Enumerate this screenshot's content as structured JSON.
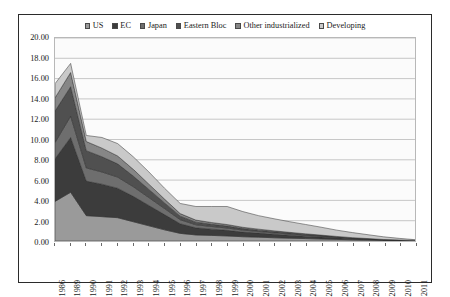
{
  "legend": {
    "position": "top",
    "items": [
      {
        "label": "US",
        "color": "#9a9a9a"
      },
      {
        "label": "EC",
        "color": "#3c3c3c"
      },
      {
        "label": "Japan",
        "color": "#6e6e6e"
      },
      {
        "label": "Eastern Bloc",
        "color": "#505050"
      },
      {
        "label": "Other industrialized",
        "color": "#868686"
      },
      {
        "label": "Developing",
        "color": "#c9c9c9"
      }
    ]
  },
  "axis": {
    "y_ticks": [
      "20.00",
      "18.00",
      "16.00",
      "14.00",
      "12.00",
      "10.00",
      "8.00",
      "6.00",
      "4.00",
      "2.00",
      "0.00"
    ]
  },
  "chart_data": {
    "type": "area",
    "stacked": true,
    "title": "",
    "xlabel": "",
    "ylabel": "",
    "ylim": [
      0,
      20
    ],
    "ytick_step": 2,
    "grid": true,
    "legend_position": "top",
    "categories": [
      "1986",
      "1989",
      "1990",
      "1991",
      "1992",
      "1993",
      "1994",
      "1995",
      "1996",
      "1997",
      "1998",
      "1999",
      "2000",
      "2001",
      "2002",
      "2003",
      "2004",
      "2005",
      "2006",
      "2007",
      "2008",
      "2009",
      "2010",
      "2011"
    ],
    "series": [
      {
        "name": "US",
        "color": "#9a9a9a",
        "values": [
          3.9,
          4.8,
          2.5,
          2.4,
          2.3,
          1.9,
          1.5,
          1.1,
          0.75,
          0.6,
          0.55,
          0.5,
          0.42,
          0.38,
          0.32,
          0.28,
          0.24,
          0.2,
          0.16,
          0.12,
          0.09,
          0.06,
          0.04,
          0.02
        ]
      },
      {
        "name": "EC",
        "color": "#3c3c3c",
        "values": [
          4.2,
          5.4,
          3.4,
          3.2,
          2.9,
          2.5,
          2.0,
          1.5,
          0.95,
          0.7,
          0.62,
          0.55,
          0.46,
          0.4,
          0.34,
          0.29,
          0.24,
          0.19,
          0.15,
          0.11,
          0.08,
          0.05,
          0.03,
          0.02
        ]
      },
      {
        "name": "Japan",
        "color": "#6e6e6e",
        "values": [
          1.6,
          2.1,
          1.3,
          1.2,
          1.1,
          0.95,
          0.78,
          0.6,
          0.4,
          0.3,
          0.26,
          0.23,
          0.19,
          0.16,
          0.14,
          0.12,
          0.1,
          0.08,
          0.06,
          0.04,
          0.03,
          0.02,
          0.01,
          0.01
        ]
      },
      {
        "name": "Eastern Bloc",
        "color": "#505050",
        "values": [
          3.1,
          2.9,
          1.7,
          1.5,
          1.3,
          1.05,
          0.8,
          0.55,
          0.35,
          0.26,
          0.22,
          0.19,
          0.16,
          0.13,
          0.11,
          0.09,
          0.07,
          0.06,
          0.04,
          0.03,
          0.02,
          0.01,
          0.01,
          0.0
        ]
      },
      {
        "name": "Other industrialized",
        "color": "#868686",
        "values": [
          1.3,
          1.4,
          0.9,
          0.85,
          0.78,
          0.66,
          0.52,
          0.38,
          0.25,
          0.2,
          0.17,
          0.15,
          0.12,
          0.1,
          0.09,
          0.07,
          0.06,
          0.05,
          0.04,
          0.03,
          0.02,
          0.01,
          0.01,
          0.0
        ]
      },
      {
        "name": "Developing",
        "color": "#c9c9c9",
        "values": [
          1.4,
          0.9,
          0.6,
          1.05,
          1.22,
          1.24,
          1.2,
          1.07,
          1.0,
          1.34,
          1.58,
          1.78,
          1.55,
          1.33,
          1.19,
          1.05,
          0.92,
          0.78,
          0.62,
          0.5,
          0.38,
          0.26,
          0.16,
          0.08
        ]
      }
    ],
    "totals": [
      15.5,
      17.5,
      10.4,
      10.2,
      9.6,
      8.3,
      6.8,
      5.2,
      3.7,
      3.4,
      3.4,
      3.4,
      2.9,
      2.5,
      2.19,
      1.9,
      1.63,
      1.36,
      1.07,
      0.83,
      0.62,
      0.41,
      0.26,
      0.13
    ]
  }
}
